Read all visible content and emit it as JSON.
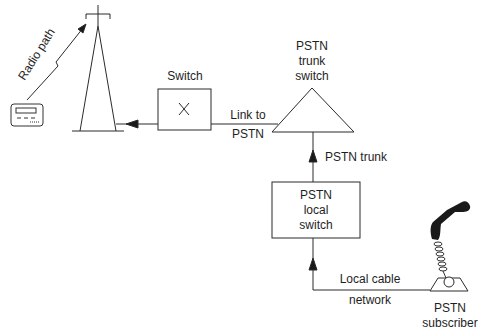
{
  "diagram": {
    "nodes": {
      "pager": {
        "label": "",
        "icon": "pager-icon"
      },
      "tower": {
        "label": "",
        "icon": "radio-tower-icon"
      },
      "switch": {
        "label": "Switch",
        "symbol": "X"
      },
      "trunk_switch": {
        "label_lines": [
          "PSTN",
          "trunk",
          "switch"
        ]
      },
      "local_switch": {
        "label_lines": [
          "PSTN",
          "local",
          "switch"
        ]
      },
      "subscriber": {
        "label_lines": [
          "PSTN",
          "subscriber"
        ],
        "icon": "telephone-icon"
      }
    },
    "edges": {
      "radio_path": {
        "label": "Radio path"
      },
      "link_to_pstn": {
        "label_lines": [
          "Link to",
          "PSTN"
        ]
      },
      "pstn_trunk": {
        "label": "PSTN trunk"
      },
      "local_cable": {
        "label_lines": [
          "Local cable",
          "network"
        ]
      }
    },
    "colors": {
      "line": "#2a2a2a",
      "background": "#ffffff",
      "handset": "#1a1a1a"
    }
  }
}
